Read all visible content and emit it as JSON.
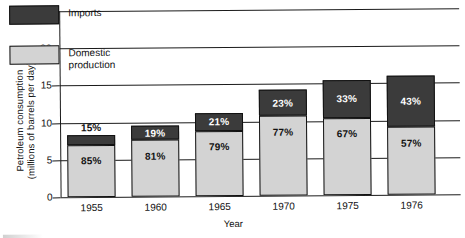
{
  "chart_data": {
    "type": "bar",
    "title": "",
    "xlabel": "Year",
    "ylabel": "Petroleum consumption\n(millions of barrels per day)",
    "ylabel_line1": "Petroleum consumption",
    "ylabel_line2": "(millions of barrels per day)",
    "categories": [
      "1955",
      "1960",
      "1965",
      "1970",
      "1975",
      "1976"
    ],
    "ylim": [
      0,
      25
    ],
    "yticks": [
      0,
      5,
      10,
      15,
      20,
      25
    ],
    "ytick_labels": [
      "0",
      "5",
      "10",
      "15",
      "20",
      "25"
    ],
    "grid": true,
    "stacked": true,
    "legend_position": "upper-left-inside",
    "series": [
      {
        "name": "Domestic production",
        "color": "#d3d3d3",
        "values": [
          7.0,
          7.6,
          8.8,
          10.7,
          10.4,
          9.1
        ],
        "labels": [
          "85%",
          "81%",
          "79%",
          "77%",
          "67%",
          "57%"
        ]
      },
      {
        "name": "Imports",
        "color": "#3b3b3b",
        "values": [
          1.3,
          1.9,
          2.4,
          3.5,
          5.1,
          6.9
        ],
        "labels": [
          "15%",
          "19%",
          "21%",
          "23%",
          "33%",
          "43%"
        ]
      }
    ],
    "totals": [
      8.3,
      9.5,
      11.2,
      14.2,
      15.5,
      16.0
    ],
    "annotations": [
      {
        "text": "15%",
        "series": "Imports",
        "category": "1955",
        "placement": "above-bar"
      }
    ]
  },
  "legend": {
    "items": [
      {
        "label": "Imports",
        "swatch": "dark"
      },
      {
        "label": "Domestic\nproduction",
        "swatch": "light"
      }
    ]
  }
}
